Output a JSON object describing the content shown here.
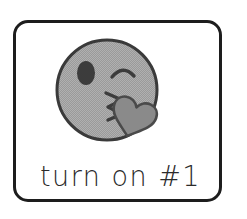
{
  "card": {
    "caption": "turn on #1",
    "border_color": "#1d1d1d",
    "background_color": "#ffffff"
  },
  "emoji": {
    "name": "face-blowing-a-kiss",
    "face_fill": "#a9a9a9",
    "face_outline": "#3a3a3a",
    "eye_color": "#3a3a3a",
    "mouth_color": "#3a3a3a",
    "heart_fill": "#8a8a8a",
    "heart_outline": "#4a4a4a",
    "parts": {
      "face": "face-circle",
      "left_eye": "open-eye-oval",
      "right_eye": "winking-eye-arc",
      "mouth": "puckered-kissing-lips",
      "heart": "blown-kiss-heart"
    }
  }
}
